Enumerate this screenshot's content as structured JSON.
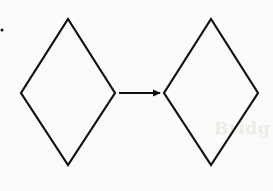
{
  "diagram": {
    "stroke_color": "#111111",
    "background_color": "#fbfbfa",
    "stroke_width": 2.2,
    "shapes": [
      {
        "id": "diamond-left",
        "type": "rhombus",
        "top": [
          68,
          19
        ],
        "right": [
          115,
          93
        ],
        "bottom": [
          68,
          165
        ],
        "left": [
          21,
          93
        ]
      },
      {
        "id": "diamond-right",
        "type": "rhombus",
        "top": [
          211,
          19
        ],
        "right": [
          258,
          93
        ],
        "bottom": [
          211,
          165
        ],
        "left": [
          164,
          93
        ]
      }
    ],
    "connectors": [
      {
        "id": "arrow",
        "from": "diamond-left",
        "to": "diamond-right",
        "x1": 119,
        "y1": 93,
        "x2": 161,
        "y2": 93,
        "head": "filled-triangle"
      }
    ],
    "marks": [
      {
        "id": "stray-dot",
        "x": 2,
        "y": 30,
        "r": 1.5
      }
    ],
    "ghost_text": "Bridg"
  }
}
